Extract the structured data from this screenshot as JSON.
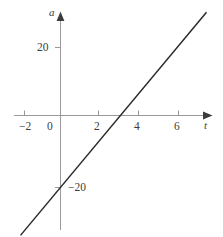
{
  "figure": {
    "background_color": "#ffffff",
    "axis_color": "#9a9a9a",
    "line_color": "#2b2b2b",
    "text_color": "#3c3c3c"
  },
  "axes": {
    "x_axis_label": "t",
    "y_axis_label": "a",
    "origin_label": "0"
  },
  "chart_data": {
    "type": "line",
    "title": "",
    "xlabel": "t",
    "ylabel": "a",
    "xlim": [
      -2.9,
      7.6
    ],
    "ylim": [
      -31,
      29
    ],
    "grid": false,
    "legend": null,
    "x_ticks": [
      -2,
      0,
      2,
      4,
      6
    ],
    "x_tick_labels": [
      "−2",
      "0",
      "2",
      "4",
      "6"
    ],
    "y_ticks": [
      20,
      -20
    ],
    "y_tick_labels": [
      "20",
      "−20"
    ],
    "series": [
      {
        "name": "a(t)",
        "slope": 6.6667,
        "intercept": -20,
        "x": [
          -2.0,
          7.3
        ],
        "values": [
          -33.3,
          28.7
        ],
        "x_intercept": 3,
        "y_intercept": -20
      }
    ],
    "annotations": []
  }
}
